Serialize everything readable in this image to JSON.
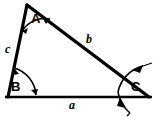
{
  "figure": {
    "kind": "geometry-diagram",
    "shape": "triangle",
    "background_color": "#ffffff",
    "stroke_color": "#000000",
    "title": ""
  },
  "vertices": [
    {
      "id": "A",
      "label": "A",
      "x": 27,
      "y": 5,
      "label_x": 31,
      "label_y": 12,
      "angle_marker": "double-arrow-arc"
    },
    {
      "id": "B",
      "label": "B",
      "x": 8,
      "y": 97,
      "label_x": 11,
      "label_y": 80,
      "angle_marker": "double-arrow-arc"
    },
    {
      "id": "C",
      "label": "C",
      "x": 148,
      "y": 97,
      "label_x": 131,
      "label_y": 80,
      "angle_marker": "crossing-double-arrow-arc"
    }
  ],
  "sides": [
    {
      "id": "a",
      "label": "a",
      "from": "B",
      "to": "C",
      "label_x": 69,
      "label_y": 99
    },
    {
      "id": "b",
      "label": "b",
      "from": "A",
      "to": "C",
      "label_x": 86,
      "label_y": 33
    },
    {
      "id": "c",
      "label": "c",
      "from": "A",
      "to": "B",
      "label_x": 5,
      "label_y": 43
    }
  ],
  "strokes": {
    "side_width": 3.2,
    "arc_width": 1.6,
    "baseline_width": 2.6
  }
}
